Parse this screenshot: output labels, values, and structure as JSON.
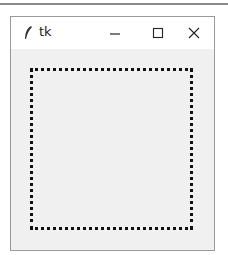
{
  "window": {
    "title": "tk",
    "app_icon": "tk-feather-icon",
    "controls": {
      "minimize": "minimize-icon",
      "maximize": "maximize-icon",
      "close": "close-icon"
    }
  },
  "canvas": {
    "shape": "dotted-rectangle",
    "stroke_color": "#111111",
    "background": "#f0f0f0"
  }
}
